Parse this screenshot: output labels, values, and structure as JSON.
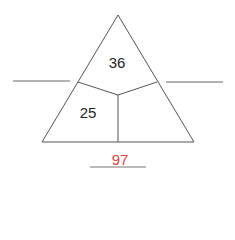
{
  "diagram": {
    "type": "triangle-puzzle",
    "regions": {
      "top": "36",
      "bottom_left": "25",
      "bottom_right": ""
    },
    "answer": "97",
    "colors": {
      "lines": "#555555",
      "text": "#222222",
      "answer": "#e8413c"
    }
  }
}
